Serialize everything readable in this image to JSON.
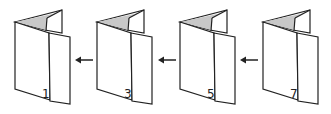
{
  "diagram": {
    "colors": {
      "stroke": "#222222",
      "fold_shade": "#c8c8c8",
      "background": "#ffffff"
    },
    "panels": [
      {
        "label": "1",
        "x": 15
      },
      {
        "label": "3",
        "x": 97
      },
      {
        "label": "5",
        "x": 180
      },
      {
        "label": "7",
        "x": 263
      }
    ],
    "arrows": [
      {
        "from": "3",
        "to": "1",
        "direction": "left"
      },
      {
        "from": "5",
        "to": "3",
        "direction": "left"
      },
      {
        "from": "7",
        "to": "5",
        "direction": "left"
      }
    ]
  }
}
